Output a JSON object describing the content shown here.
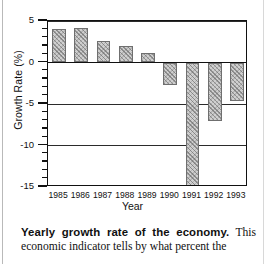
{
  "chart_data": {
    "type": "bar",
    "title": "",
    "xlabel": "Year",
    "ylabel": "Growth Rate (%)",
    "categories": [
      "1985",
      "1986",
      "1987",
      "1988",
      "1989",
      "1990",
      "1991",
      "1992",
      "1993"
    ],
    "values": [
      4.0,
      4.1,
      2.6,
      2.0,
      1.2,
      -2.7,
      -15.0,
      -7.0,
      -4.6
    ],
    "ylim": [
      -15,
      5
    ],
    "yticks_major": [
      5,
      0,
      -5,
      -10,
      -15
    ],
    "ytick_labels": [
      "5",
      "0",
      "-5",
      "-10",
      "-15"
    ],
    "ytick_minor_step": 1,
    "grid": "horizontal gridlines at 5, 0, -5, -10, -15",
    "legend": "none",
    "bar_fill": "#cfcfcf",
    "bar_hatch": "cross-hatch / stipple",
    "axis_color": "#111111"
  },
  "caption": {
    "bold_lead": "Yearly growth rate of the economy.",
    "body": " This economic indicator tells by what percent the"
  }
}
